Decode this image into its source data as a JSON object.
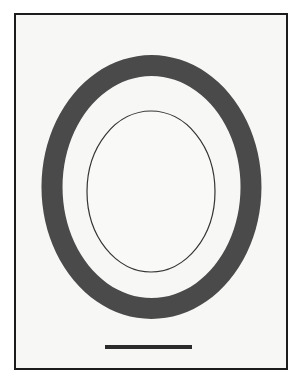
{
  "figure": {
    "domain_type": "scientific-micrograph",
    "canvas": {
      "width": 301,
      "height": 383
    },
    "background_color": "#ffffff",
    "caption_text": "",
    "frame": {
      "name": "image-frame",
      "x": 14,
      "y": 13,
      "width": 274,
      "height": 357,
      "fill_color": "#f7f7f5",
      "border_color": "#1c1c1c",
      "border_width": 2
    },
    "annulus": {
      "name": "dark-annulus",
      "center_x": 151.5,
      "center_y": 187,
      "outer_rx": 110,
      "outer_ry": 132,
      "inner_rx": 89,
      "inner_ry": 111,
      "fill_color": "#4a4a4a"
    },
    "inner_outline_ellipse": {
      "name": "inner-outline-ellipse",
      "center_x": 151,
      "center_y": 191.5,
      "rx": 64,
      "ry": 80.5,
      "stroke_color": "#353535",
      "stroke_width": 1.2,
      "fill_color": "#f9f9f7"
    },
    "scale_bar": {
      "name": "scale-bar",
      "x": 105,
      "y": 345,
      "width": 87,
      "height": 4,
      "color": "#2b2b2b",
      "label": ""
    }
  }
}
